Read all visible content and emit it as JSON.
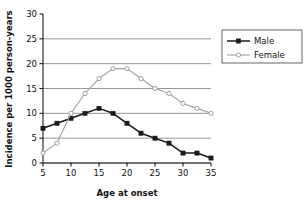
{
  "chart_data": {
    "type": "line",
    "title": "",
    "xlabel": "Age at onset",
    "ylabel": "Incidence per 1000 person-years",
    "x": [
      5,
      7.5,
      10,
      12.5,
      15,
      17.5,
      20,
      22.5,
      25,
      27.5,
      30,
      32.5,
      35
    ],
    "xlim": [
      5,
      35
    ],
    "ylim": [
      0,
      30
    ],
    "xticks": [
      "5",
      "10",
      "15",
      "20",
      "25",
      "30",
      "35"
    ],
    "xtick_values": [
      5,
      10,
      15,
      20,
      25,
      30,
      35
    ],
    "yticks": [
      "0",
      "5",
      "10",
      "15",
      "20",
      "25",
      "30"
    ],
    "ytick_values": [
      0,
      5,
      10,
      15,
      20,
      25,
      30
    ],
    "grid": "horizontal",
    "gridline_values": [
      0,
      5,
      10,
      15,
      20,
      25
    ],
    "legend_position": "right",
    "series": [
      {
        "name": "Male",
        "color": "#1a1a1a",
        "marker": "filled-square",
        "values": [
          7,
          8,
          9,
          10,
          11,
          10,
          8,
          6,
          5,
          4,
          2,
          2,
          1
        ]
      },
      {
        "name": "Female",
        "color": "#a0a0a0",
        "marker": "open-circle",
        "values": [
          2,
          4,
          10,
          14,
          17,
          19,
          19,
          17,
          15,
          14,
          12,
          11,
          10
        ]
      }
    ]
  },
  "colors": {
    "male": "#1a1a1a",
    "female": "#a0a0a0",
    "grid": "#8c8c8c",
    "axis": "#1a1a1a",
    "legend_border": "#555555",
    "background": "#ffffff"
  }
}
